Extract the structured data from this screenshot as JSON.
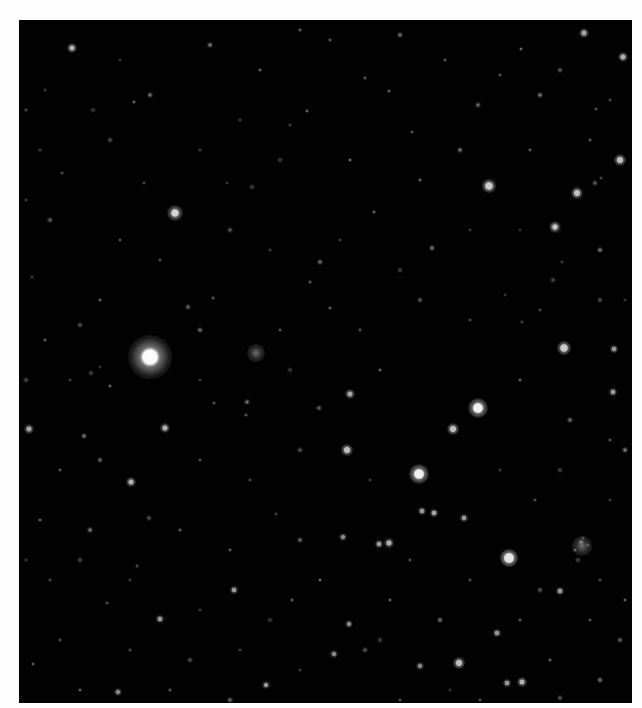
{
  "image": {
    "subject": "star field",
    "frame": {
      "x": 19,
      "y": 20,
      "width": 613,
      "height": 683
    },
    "background_color": "#020202",
    "page_color": "#fdfdfd"
  },
  "bright_stars": [
    {
      "x": 150,
      "y": 357,
      "core": 7,
      "glow": 22,
      "brightness": 1.0
    },
    {
      "x": 478,
      "y": 408,
      "core": 4,
      "glow": 10,
      "brightness": 0.95
    },
    {
      "x": 419,
      "y": 474,
      "core": 4,
      "glow": 10,
      "brightness": 0.95
    },
    {
      "x": 509,
      "y": 558,
      "core": 4,
      "glow": 9,
      "brightness": 0.9
    },
    {
      "x": 175,
      "y": 213,
      "core": 3,
      "glow": 8,
      "brightness": 0.85
    },
    {
      "x": 489,
      "y": 186,
      "core": 3,
      "glow": 7,
      "brightness": 0.8
    },
    {
      "x": 577,
      "y": 193,
      "core": 2.5,
      "glow": 6,
      "brightness": 0.75
    },
    {
      "x": 620,
      "y": 160,
      "core": 2.5,
      "glow": 6,
      "brightness": 0.75
    },
    {
      "x": 564,
      "y": 348,
      "core": 3,
      "glow": 7,
      "brightness": 0.8
    },
    {
      "x": 453,
      "y": 429,
      "core": 2.5,
      "glow": 6,
      "brightness": 0.75
    },
    {
      "x": 347,
      "y": 450,
      "core": 2.5,
      "glow": 6,
      "brightness": 0.75
    },
    {
      "x": 459,
      "y": 663,
      "core": 2.5,
      "glow": 6,
      "brightness": 0.75
    },
    {
      "x": 72,
      "y": 48,
      "core": 2,
      "glow": 5,
      "brightness": 0.7
    },
    {
      "x": 623,
      "y": 57,
      "core": 2,
      "glow": 5,
      "brightness": 0.7
    },
    {
      "x": 584,
      "y": 33,
      "core": 2,
      "glow": 5,
      "brightness": 0.65
    },
    {
      "x": 165,
      "y": 428,
      "core": 2,
      "glow": 5,
      "brightness": 0.7
    },
    {
      "x": 131,
      "y": 482,
      "core": 2,
      "glow": 5,
      "brightness": 0.7
    },
    {
      "x": 29,
      "y": 429,
      "core": 2,
      "glow": 5,
      "brightness": 0.65
    },
    {
      "x": 555,
      "y": 227,
      "core": 2,
      "glow": 5,
      "brightness": 0.7
    },
    {
      "x": 350,
      "y": 394,
      "core": 2,
      "glow": 5,
      "brightness": 0.65
    },
    {
      "x": 389,
      "y": 543,
      "core": 2,
      "glow": 5,
      "brightness": 0.7
    },
    {
      "x": 379,
      "y": 544,
      "core": 1.8,
      "glow": 4,
      "brightness": 0.6
    },
    {
      "x": 434,
      "y": 513,
      "core": 1.8,
      "glow": 4,
      "brightness": 0.65
    },
    {
      "x": 422,
      "y": 511,
      "core": 1.8,
      "glow": 4,
      "brightness": 0.6
    },
    {
      "x": 464,
      "y": 518,
      "core": 1.8,
      "glow": 4,
      "brightness": 0.6
    },
    {
      "x": 522,
      "y": 682,
      "core": 2,
      "glow": 5,
      "brightness": 0.7
    },
    {
      "x": 507,
      "y": 683,
      "core": 1.8,
      "glow": 4,
      "brightness": 0.6
    },
    {
      "x": 497,
      "y": 633,
      "core": 1.8,
      "glow": 4,
      "brightness": 0.6
    },
    {
      "x": 560,
      "y": 591,
      "core": 1.8,
      "glow": 4,
      "brightness": 0.6
    },
    {
      "x": 234,
      "y": 590,
      "core": 1.8,
      "glow": 4,
      "brightness": 0.6
    },
    {
      "x": 160,
      "y": 619,
      "core": 1.8,
      "glow": 4,
      "brightness": 0.6
    },
    {
      "x": 613,
      "y": 392,
      "core": 1.8,
      "glow": 4,
      "brightness": 0.6
    },
    {
      "x": 614,
      "y": 349,
      "core": 1.8,
      "glow": 4,
      "brightness": 0.6
    },
    {
      "x": 343,
      "y": 537,
      "core": 1.6,
      "glow": 4,
      "brightness": 0.55
    },
    {
      "x": 334,
      "y": 654,
      "core": 1.6,
      "glow": 4,
      "brightness": 0.55
    },
    {
      "x": 420,
      "y": 666,
      "core": 1.6,
      "glow": 4,
      "brightness": 0.55
    },
    {
      "x": 349,
      "y": 624,
      "core": 1.6,
      "glow": 4,
      "brightness": 0.55
    },
    {
      "x": 266,
      "y": 685,
      "core": 1.6,
      "glow": 4,
      "brightness": 0.55
    },
    {
      "x": 118,
      "y": 692,
      "core": 1.6,
      "glow": 4,
      "brightness": 0.55
    }
  ],
  "faint_stars": [
    [
      93,
      110
    ],
    [
      134,
      102
    ],
    [
      307,
      111
    ],
    [
      320,
      262
    ],
    [
      310,
      282
    ],
    [
      213,
      298
    ],
    [
      188,
      307
    ],
    [
      62,
      173
    ],
    [
      144,
      183
    ],
    [
      80,
      325
    ],
    [
      32,
      277
    ],
    [
      290,
      125
    ],
    [
      252,
      187
    ],
    [
      227,
      183
    ],
    [
      521,
      49
    ],
    [
      540,
      95
    ],
    [
      389,
      91
    ],
    [
      365,
      78
    ],
    [
      478,
      105
    ],
    [
      412,
      132
    ],
    [
      596,
      109
    ],
    [
      595,
      183
    ],
    [
      601,
      178
    ],
    [
      522,
      322
    ],
    [
      553,
      280
    ],
    [
      562,
      262
    ],
    [
      505,
      295
    ],
    [
      432,
      248
    ],
    [
      374,
      212
    ],
    [
      330,
      308
    ],
    [
      247,
      402
    ],
    [
      246,
      415
    ],
    [
      214,
      403
    ],
    [
      319,
      408
    ],
    [
      107,
      603
    ],
    [
      137,
      566
    ],
    [
      149,
      518
    ],
    [
      276,
      514
    ],
    [
      266,
      685
    ],
    [
      91,
      373
    ],
    [
      100,
      367
    ],
    [
      110,
      386
    ],
    [
      84,
      436
    ],
    [
      292,
      600
    ],
    [
      33,
      664
    ],
    [
      581,
      542
    ],
    [
      575,
      550
    ],
    [
      535,
      500
    ],
    [
      365,
      650
    ],
    [
      588,
      545
    ],
    [
      583,
      538
    ],
    [
      578,
      560
    ],
    [
      45,
      90
    ],
    [
      120,
      60
    ],
    [
      210,
      45
    ],
    [
      260,
      70
    ],
    [
      330,
      40
    ],
    [
      400,
      35
    ],
    [
      445,
      60
    ],
    [
      500,
      75
    ],
    [
      560,
      70
    ],
    [
      610,
      100
    ],
    [
      40,
      150
    ],
    [
      110,
      140
    ],
    [
      200,
      150
    ],
    [
      240,
      120
    ],
    [
      280,
      160
    ],
    [
      350,
      160
    ],
    [
      420,
      180
    ],
    [
      460,
      150
    ],
    [
      530,
      150
    ],
    [
      590,
      140
    ],
    [
      50,
      220
    ],
    [
      120,
      240
    ],
    [
      160,
      260
    ],
    [
      230,
      230
    ],
    [
      270,
      250
    ],
    [
      340,
      240
    ],
    [
      400,
      270
    ],
    [
      470,
      230
    ],
    [
      520,
      230
    ],
    [
      600,
      250
    ],
    [
      45,
      340
    ],
    [
      100,
      300
    ],
    [
      200,
      330
    ],
    [
      280,
      330
    ],
    [
      360,
      330
    ],
    [
      420,
      300
    ],
    [
      470,
      320
    ],
    [
      540,
      310
    ],
    [
      600,
      300
    ],
    [
      70,
      380
    ],
    [
      200,
      380
    ],
    [
      290,
      370
    ],
    [
      380,
      370
    ],
    [
      520,
      380
    ],
    [
      570,
      420
    ],
    [
      610,
      440
    ],
    [
      60,
      470
    ],
    [
      100,
      460
    ],
    [
      200,
      460
    ],
    [
      250,
      480
    ],
    [
      300,
      450
    ],
    [
      370,
      480
    ],
    [
      500,
      470
    ],
    [
      560,
      470
    ],
    [
      610,
      500
    ],
    [
      40,
      520
    ],
    [
      90,
      530
    ],
    [
      180,
      530
    ],
    [
      230,
      550
    ],
    [
      300,
      540
    ],
    [
      410,
      560
    ],
    [
      470,
      580
    ],
    [
      540,
      590
    ],
    [
      600,
      580
    ],
    [
      50,
      580
    ],
    [
      80,
      560
    ],
    [
      130,
      580
    ],
    [
      200,
      610
    ],
    [
      270,
      620
    ],
    [
      320,
      580
    ],
    [
      390,
      600
    ],
    [
      440,
      620
    ],
    [
      520,
      620
    ],
    [
      590,
      620
    ],
    [
      620,
      640
    ],
    [
      60,
      640
    ],
    [
      130,
      650
    ],
    [
      190,
      660
    ],
    [
      240,
      650
    ],
    [
      300,
      670
    ],
    [
      380,
      640
    ],
    [
      450,
      690
    ],
    [
      550,
      660
    ],
    [
      600,
      680
    ],
    [
      80,
      690
    ],
    [
      170,
      690
    ],
    [
      230,
      700
    ],
    [
      400,
      700
    ],
    [
      480,
      700
    ],
    [
      560,
      698
    ],
    [
      26,
      110
    ],
    [
      26,
      200
    ],
    [
      26,
      380
    ],
    [
      26,
      560
    ],
    [
      625,
      300
    ],
    [
      625,
      450
    ],
    [
      625,
      600
    ],
    [
      300,
      30
    ],
    [
      150,
      95
    ]
  ],
  "clusters": [
    {
      "x": 256,
      "y": 353,
      "r": 9
    },
    {
      "x": 582,
      "y": 546,
      "r": 10
    },
    {
      "x": 555,
      "y": 227,
      "r": 6
    }
  ]
}
